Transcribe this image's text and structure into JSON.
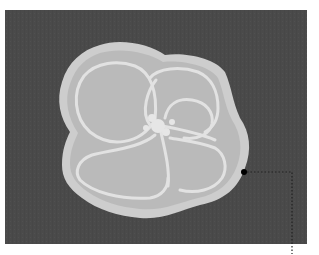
{
  "figure": {
    "colors": {
      "page_background": "#ffffff",
      "photo_background": "#4a4a4a",
      "shell_outer_rim": "#cdcdcd",
      "shell_interior": "#b9b9b9",
      "chamber_walls": "#e2e2e2",
      "marker": "#000000",
      "leader_line": "#222222"
    },
    "annotation": {
      "marker_type": "dot",
      "leader_style": "dotted",
      "label": ""
    }
  }
}
